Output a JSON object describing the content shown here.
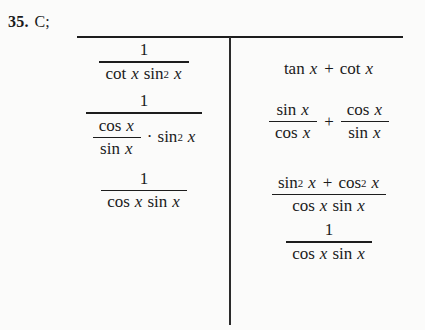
{
  "problem": {
    "number": "35.",
    "answer_choice": "C;"
  },
  "left_column": {
    "step1": {
      "numerator": "1",
      "denominator_parts": {
        "fn1": "cot",
        "var1": "x",
        "fn2": "sin",
        "exponent": "2",
        "var2": "x"
      }
    },
    "step2": {
      "numerator": "1",
      "denominator": {
        "inner_fraction": {
          "numerator_fn": "cos",
          "numerator_var": "x",
          "denominator_fn": "sin",
          "denominator_var": "x"
        },
        "operator": "·",
        "factor": {
          "fn": "sin",
          "exponent": "2",
          "var": "x"
        }
      }
    },
    "step3": {
      "numerator": "1",
      "denominator_parts": {
        "fn1": "cos",
        "var1": "x",
        "fn2": "sin",
        "var2": "x"
      }
    }
  },
  "right_column": {
    "step1": {
      "term1_fn": "tan",
      "term1_var": "x",
      "operator": "+",
      "term2_fn": "cot",
      "term2_var": "x"
    },
    "step2": {
      "fraction1": {
        "numerator_fn": "sin",
        "numerator_var": "x",
        "denominator_fn": "cos",
        "denominator_var": "x"
      },
      "operator": "+",
      "fraction2": {
        "numerator_fn": "cos",
        "numerator_var": "x",
        "denominator_fn": "sin",
        "denominator_var": "x"
      }
    },
    "step3": {
      "numerator": {
        "fn1": "sin",
        "exp1": "2",
        "var1": "x",
        "operator": "+",
        "fn2": "cos",
        "exp2": "2",
        "var2": "x"
      },
      "denominator": {
        "fn1": "cos",
        "var1": "x",
        "fn2": "sin",
        "var2": "x"
      }
    },
    "step4": {
      "numerator": "1",
      "denominator": {
        "fn1": "cos",
        "var1": "x",
        "fn2": "sin",
        "var2": "x"
      }
    }
  },
  "colors": {
    "ink": "#1a1a1a",
    "page_background": "#fbfbfa",
    "rule": "#1d1d1d"
  }
}
